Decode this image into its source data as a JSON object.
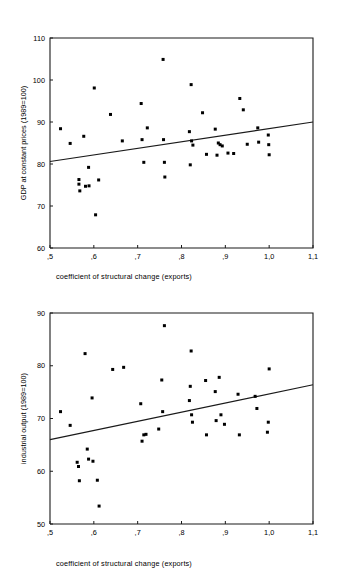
{
  "chart_data": [
    {
      "type": "scatter",
      "id": "gdp-vs-structural-change",
      "title": "",
      "xlabel": "coefficient of structural change (exports)",
      "ylabel": "GDP at constant prices (1989=100)",
      "xlim": [
        0.5,
        1.1
      ],
      "ylim": [
        60,
        110
      ],
      "xticks": [
        0.5,
        0.6,
        0.7,
        0.8,
        0.9,
        1.0,
        1.1
      ],
      "xticklabels": [
        ",5",
        ",6",
        ",7",
        ",8",
        ",9",
        "1,0",
        "1,1"
      ],
      "yticks": [
        60,
        70,
        80,
        90,
        100,
        110
      ],
      "yticklabels": [
        "60",
        "70",
        "80",
        "90",
        "100",
        "110"
      ],
      "grid": false,
      "legend": false,
      "marker": "square",
      "marker_color": "#000000",
      "points": [
        [
          0.524,
          88.4
        ],
        [
          0.546,
          84.9
        ],
        [
          0.566,
          76.3
        ],
        [
          0.566,
          75.2
        ],
        [
          0.568,
          73.6
        ],
        [
          0.577,
          86.6
        ],
        [
          0.581,
          74.7
        ],
        [
          0.588,
          79.2
        ],
        [
          0.589,
          74.8
        ],
        [
          0.601,
          98.1
        ],
        [
          0.604,
          67.9
        ],
        [
          0.611,
          76.2
        ],
        [
          0.638,
          91.8
        ],
        [
          0.665,
          85.5
        ],
        [
          0.708,
          94.4
        ],
        [
          0.71,
          85.8
        ],
        [
          0.714,
          80.4
        ],
        [
          0.722,
          88.6
        ],
        [
          0.758,
          104.9
        ],
        [
          0.759,
          85.8
        ],
        [
          0.761,
          80.4
        ],
        [
          0.762,
          76.9
        ],
        [
          0.818,
          87.7
        ],
        [
          0.82,
          79.8
        ],
        [
          0.822,
          98.9
        ],
        [
          0.823,
          85.5
        ],
        [
          0.826,
          84.5
        ],
        [
          0.848,
          92.2
        ],
        [
          0.857,
          82.3
        ],
        [
          0.877,
          88.3
        ],
        [
          0.881,
          82.1
        ],
        [
          0.884,
          85.0
        ],
        [
          0.888,
          84.6
        ],
        [
          0.893,
          84.3
        ],
        [
          0.906,
          82.6
        ],
        [
          0.919,
          82.5
        ],
        [
          0.933,
          95.6
        ],
        [
          0.941,
          92.9
        ],
        [
          0.95,
          84.7
        ],
        [
          0.974,
          88.6
        ],
        [
          0.976,
          85.2
        ],
        [
          0.998,
          86.9
        ],
        [
          0.999,
          84.6
        ],
        [
          1.0,
          82.2
        ]
      ],
      "trendline": {
        "x1": 0.5,
        "y1": 80.6,
        "x2": 1.1,
        "y2": 90.0
      }
    },
    {
      "type": "scatter",
      "id": "industrial-output-vs-structural-change",
      "title": "",
      "xlabel": "coefficient of structural change (exports)",
      "ylabel": "industrial output (1989=100)",
      "xlim": [
        0.5,
        1.1
      ],
      "ylim": [
        50,
        90
      ],
      "xticks": [
        0.5,
        0.6,
        0.7,
        0.8,
        0.9,
        1.0,
        1.1
      ],
      "xticklabels": [
        ",5",
        ",6",
        ",7",
        ",8",
        ",9",
        "1,0",
        "1,1"
      ],
      "yticks": [
        50,
        60,
        70,
        80,
        90
      ],
      "yticklabels": [
        "50",
        "60",
        "70",
        "80",
        "90"
      ],
      "grid": false,
      "legend": false,
      "marker": "square",
      "marker_color": "#000000",
      "points": [
        [
          0.524,
          71.3
        ],
        [
          0.546,
          68.7
        ],
        [
          0.562,
          61.7
        ],
        [
          0.565,
          60.9
        ],
        [
          0.567,
          58.2
        ],
        [
          0.58,
          82.3
        ],
        [
          0.585,
          64.2
        ],
        [
          0.588,
          62.3
        ],
        [
          0.596,
          73.9
        ],
        [
          0.598,
          61.9
        ],
        [
          0.608,
          58.3
        ],
        [
          0.612,
          53.4
        ],
        [
          0.643,
          79.3
        ],
        [
          0.668,
          79.7
        ],
        [
          0.707,
          72.8
        ],
        [
          0.71,
          65.7
        ],
        [
          0.714,
          66.9
        ],
        [
          0.719,
          67.0
        ],
        [
          0.748,
          68.0
        ],
        [
          0.755,
          77.3
        ],
        [
          0.757,
          71.3
        ],
        [
          0.761,
          87.6
        ],
        [
          0.818,
          73.4
        ],
        [
          0.82,
          76.1
        ],
        [
          0.822,
          82.8
        ],
        [
          0.823,
          70.7
        ],
        [
          0.825,
          69.3
        ],
        [
          0.855,
          77.2
        ],
        [
          0.857,
          66.9
        ],
        [
          0.877,
          75.1
        ],
        [
          0.879,
          69.6
        ],
        [
          0.886,
          77.8
        ],
        [
          0.89,
          70.7
        ],
        [
          0.898,
          68.9
        ],
        [
          0.929,
          74.6
        ],
        [
          0.932,
          66.9
        ],
        [
          0.968,
          74.2
        ],
        [
          0.972,
          71.9
        ],
        [
          0.996,
          67.4
        ],
        [
          0.998,
          69.3
        ],
        [
          1.0,
          79.4
        ]
      ],
      "trendline": {
        "x1": 0.5,
        "y1": 66.0,
        "x2": 1.1,
        "y2": 76.4
      }
    }
  ],
  "figures": {
    "gdp": {
      "xlabel": "coefficient of structural change (exports)",
      "ylabel": "GDP at constant prices (1989=100)"
    },
    "industry": {
      "xlabel": "coefficient of structural change (exports)",
      "ylabel": "industrial output (1989=100)"
    }
  }
}
